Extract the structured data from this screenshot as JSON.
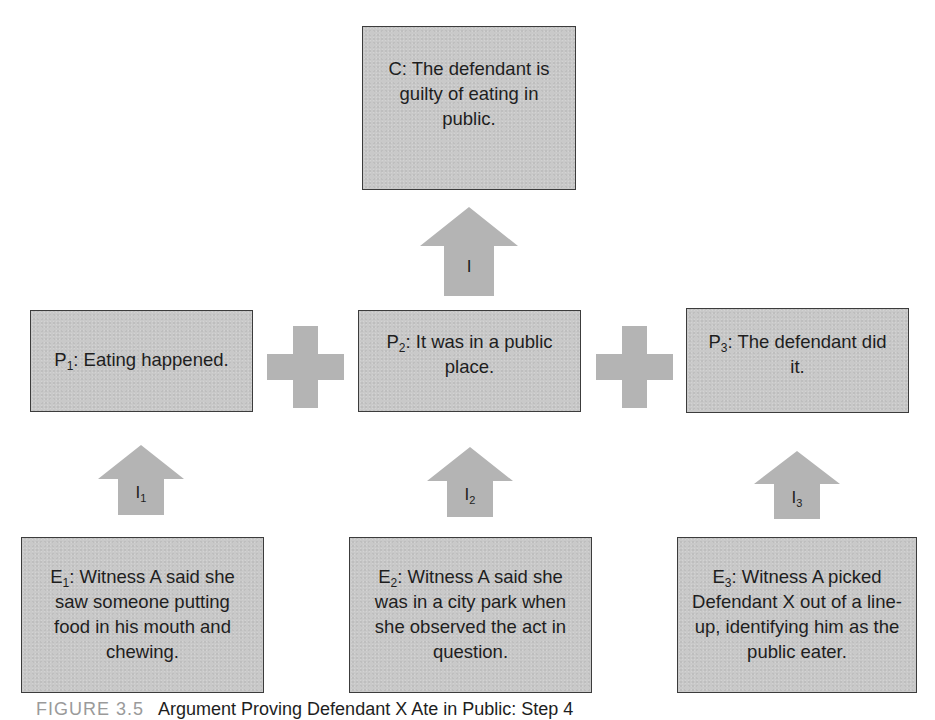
{
  "diagram": {
    "conclusion": {
      "prefix": "C",
      "subscript": "",
      "text": ": The defendant is guilty of eating in public."
    },
    "conclusion_inference": {
      "label": "I",
      "subscript": ""
    },
    "propositions": [
      {
        "prefix": "P",
        "subscript": "1",
        "text": ": Eating happened."
      },
      {
        "prefix": "P",
        "subscript": "2",
        "text": ": It was in a public place."
      },
      {
        "prefix": "P",
        "subscript": "3",
        "text": ": The defendant did it."
      }
    ],
    "connectors": [
      {
        "symbol": "plus"
      },
      {
        "symbol": "plus"
      }
    ],
    "inferences": [
      {
        "label": "I",
        "subscript": "1"
      },
      {
        "label": "I",
        "subscript": "2"
      },
      {
        "label": "I",
        "subscript": "3"
      }
    ],
    "evidence": [
      {
        "prefix": "E",
        "subscript": "1",
        "text": ": Witness A said she saw someone putting food in his mouth and chewing."
      },
      {
        "prefix": "E",
        "subscript": "2",
        "text": ": Witness A said she was in a city park when she observed the act in question."
      },
      {
        "prefix": "E",
        "subscript": "3",
        "text": ": Witness A picked Defendant X out of a line-up, identifying him as the public eater."
      }
    ],
    "colors": {
      "box_fill": "#c9c9c9",
      "box_border": "#3c3c3c",
      "arrow_fill": "#b4b4b4",
      "text": "#1e1e1e"
    }
  },
  "caption": {
    "figure_label": "FIGURE 3.5",
    "text": "Argument Proving Defendant X Ate in Public: Step 4"
  }
}
